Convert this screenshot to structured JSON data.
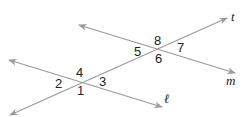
{
  "diagram": {
    "type": "parallel-lines-cut-by-transversal",
    "colors": {
      "line": "#9a9a9a",
      "text": "#222222",
      "background": "#ffffff"
    },
    "lines": [
      {
        "id": "t",
        "label": "t",
        "x1": 10,
        "y1": 115,
        "x2": 227,
        "y2": 18,
        "arrow_start": true,
        "arrow_end": true,
        "label_x": 231,
        "label_y": 21
      },
      {
        "id": "m",
        "label": "m",
        "x1": 79,
        "y1": 25,
        "x2": 235,
        "y2": 73,
        "arrow_start": true,
        "arrow_end": true,
        "label_x": 226,
        "label_y": 85
      },
      {
        "id": "l",
        "label": "ℓ",
        "x1": 9,
        "y1": 60,
        "x2": 162,
        "y2": 107,
        "arrow_start": true,
        "arrow_end": true,
        "label_x": 164,
        "label_y": 103
      }
    ],
    "intersections": [
      {
        "lines": [
          "t",
          "l"
        ],
        "x": 81,
        "y": 83
      },
      {
        "lines": [
          "t",
          "m"
        ],
        "x": 157,
        "y": 50
      }
    ],
    "angles": [
      {
        "label": "1",
        "x": 77,
        "y": 95
      },
      {
        "label": "2",
        "x": 55,
        "y": 88
      },
      {
        "label": "3",
        "x": 99,
        "y": 86
      },
      {
        "label": "4",
        "x": 76,
        "y": 77
      },
      {
        "label": "5",
        "x": 134,
        "y": 56
      },
      {
        "label": "6",
        "x": 155,
        "y": 63
      },
      {
        "label": "7",
        "x": 177,
        "y": 52
      },
      {
        "label": "8",
        "x": 154,
        "y": 45
      }
    ]
  }
}
